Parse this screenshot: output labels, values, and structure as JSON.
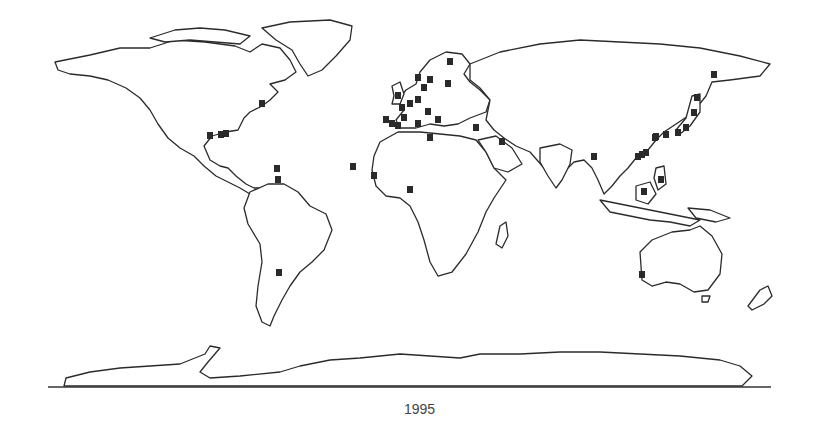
{
  "figure": {
    "caption": "1995",
    "type": "world-map-with-site-markers",
    "colors": {
      "outline": "#2b2b2b",
      "marker": "#2a2a2a",
      "background": "#ffffff"
    }
  },
  "markers": [
    {
      "region": "Europe-UK",
      "x": 398,
      "y": 96
    },
    {
      "region": "Europe-UK",
      "x": 402,
      "y": 108
    },
    {
      "region": "Europe-Benelux",
      "x": 410,
      "y": 104
    },
    {
      "region": "Europe-Germany",
      "x": 418,
      "y": 100
    },
    {
      "region": "Europe-Denmark",
      "x": 424,
      "y": 88
    },
    {
      "region": "Europe-Norway",
      "x": 418,
      "y": 78
    },
    {
      "region": "Europe-Sweden",
      "x": 430,
      "y": 80
    },
    {
      "region": "Europe-Finland",
      "x": 450,
      "y": 62
    },
    {
      "region": "Europe-Baltic",
      "x": 448,
      "y": 84
    },
    {
      "region": "Europe-France",
      "x": 404,
      "y": 118
    },
    {
      "region": "Europe-Portugal",
      "x": 386,
      "y": 120
    },
    {
      "region": "Europe-Spain",
      "x": 392,
      "y": 124
    },
    {
      "region": "Europe-Spain",
      "x": 398,
      "y": 126
    },
    {
      "region": "Europe-Italy",
      "x": 418,
      "y": 124
    },
    {
      "region": "Europe-Italy",
      "x": 428,
      "y": 112
    },
    {
      "region": "Europe-Balkans",
      "x": 438,
      "y": 120
    },
    {
      "region": "Middle-East",
      "x": 476,
      "y": 128
    },
    {
      "region": "Middle-East-Gulf",
      "x": 502,
      "y": 142
    },
    {
      "region": "North-Africa",
      "x": 430,
      "y": 138
    },
    {
      "region": "West-Africa-Canary",
      "x": 353,
      "y": 167
    },
    {
      "region": "West-Africa-Senegal",
      "x": 374,
      "y": 176
    },
    {
      "region": "West-Africa-Ghana",
      "x": 410,
      "y": 190
    },
    {
      "region": "North-America-Mexico",
      "x": 210,
      "y": 136
    },
    {
      "region": "North-America-Gulf",
      "x": 221,
      "y": 135
    },
    {
      "region": "North-America-Gulf",
      "x": 226,
      "y": 134
    },
    {
      "region": "Caribbean",
      "x": 277,
      "y": 169
    },
    {
      "region": "Caribbean-Trinidad",
      "x": 278,
      "y": 180
    },
    {
      "region": "South-America-Argentina",
      "x": 279,
      "y": 273
    },
    {
      "region": "North-America-NE",
      "x": 262,
      "y": 104
    },
    {
      "region": "Asia-Kamchatka",
      "x": 714,
      "y": 75
    },
    {
      "region": "Asia-Japan",
      "x": 697,
      "y": 98
    },
    {
      "region": "Asia-Japan",
      "x": 694,
      "y": 113
    },
    {
      "region": "Asia-Japan",
      "x": 686,
      "y": 128
    },
    {
      "region": "Asia-Japan",
      "x": 678,
      "y": 133
    },
    {
      "region": "Asia-Korea",
      "x": 666,
      "y": 135
    },
    {
      "region": "Asia-China",
      "x": 656,
      "y": 137
    },
    {
      "region": "Asia-China-Coast",
      "x": 655,
      "y": 138
    },
    {
      "region": "Asia-China-Coast",
      "x": 642,
      "y": 155
    },
    {
      "region": "Asia-China-South",
      "x": 638,
      "y": 157
    },
    {
      "region": "Asia-China-South",
      "x": 646,
      "y": 153
    },
    {
      "region": "Asia-Myanmar",
      "x": 594,
      "y": 157
    },
    {
      "region": "Asia-Philippines",
      "x": 661,
      "y": 180
    },
    {
      "region": "Asia-Borneo",
      "x": 644,
      "y": 192
    },
    {
      "region": "Australia-Perth",
      "x": 642,
      "y": 275
    }
  ]
}
